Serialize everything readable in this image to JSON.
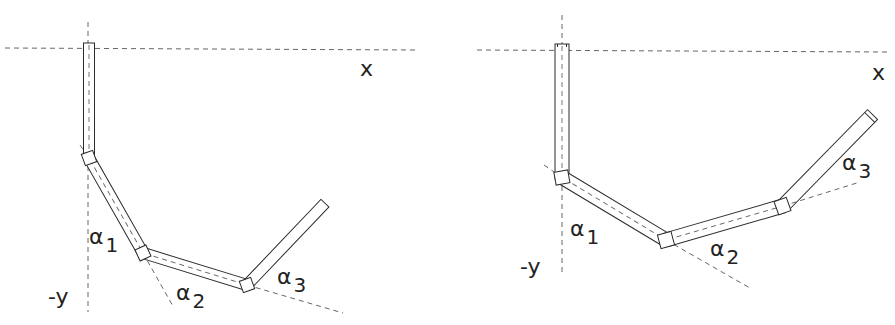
{
  "figures": [
    {
      "id": "left",
      "labels": {
        "x_axis": "x",
        "y_axis": "-y",
        "alpha1": {
          "symbol": "α",
          "index": "1"
        },
        "alpha2": {
          "symbol": "α",
          "index": "2"
        },
        "alpha3": {
          "symbol": "α",
          "index": "3"
        }
      }
    },
    {
      "id": "right",
      "labels": {
        "x_axis": "x",
        "y_axis": "-y",
        "alpha1": {
          "symbol": "α",
          "index": "1"
        },
        "alpha2": {
          "symbol": "α",
          "index": "2"
        },
        "alpha3": {
          "symbol": "α",
          "index": "3"
        }
      }
    }
  ],
  "colors": {
    "line": "#2a2a2a",
    "dash": "#555555",
    "background": "#ffffff"
  }
}
